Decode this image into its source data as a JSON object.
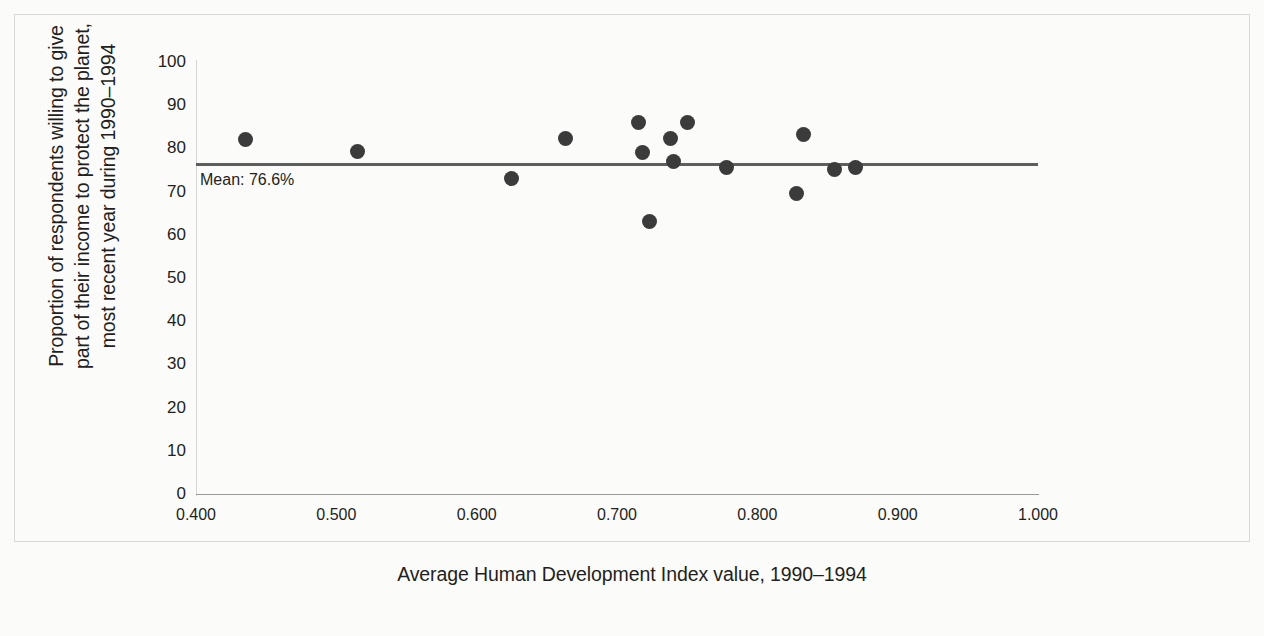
{
  "chart_data": {
    "type": "scatter",
    "title": "",
    "xlabel": "Average Human Development Index value, 1990–1994",
    "ylabel": "Proportion of respondents willing to give\npart of their income to protect the planet,\nmost recent year during 1990–1994",
    "xlim": [
      0.4,
      1.0
    ],
    "ylim": [
      0,
      100
    ],
    "xticks": [
      "0.400",
      "0.500",
      "0.600",
      "0.700",
      "0.800",
      "0.900",
      "1.000"
    ],
    "xtick_values": [
      0.4,
      0.5,
      0.6,
      0.7,
      0.8,
      0.9,
      1.0
    ],
    "yticks": [
      "100",
      "90",
      "80",
      "70",
      "60",
      "50",
      "40",
      "30",
      "20",
      "10",
      "0"
    ],
    "ytick_values": [
      100,
      90,
      80,
      70,
      60,
      50,
      40,
      30,
      20,
      10,
      0
    ],
    "grid": false,
    "legend": false,
    "marker_color": "#3b3b3b",
    "marker_size_px": 15,
    "points": [
      {
        "x": 0.435,
        "y": 82.0
      },
      {
        "x": 0.515,
        "y": 79.3
      },
      {
        "x": 0.625,
        "y": 73.0
      },
      {
        "x": 0.663,
        "y": 82.3
      },
      {
        "x": 0.715,
        "y": 86.0
      },
      {
        "x": 0.718,
        "y": 79.0
      },
      {
        "x": 0.723,
        "y": 63.0
      },
      {
        "x": 0.738,
        "y": 82.2
      },
      {
        "x": 0.74,
        "y": 77.0
      },
      {
        "x": 0.75,
        "y": 86.0
      },
      {
        "x": 0.778,
        "y": 75.5
      },
      {
        "x": 0.828,
        "y": 69.5
      },
      {
        "x": 0.833,
        "y": 83.3
      },
      {
        "x": 0.855,
        "y": 75.2
      },
      {
        "x": 0.87,
        "y": 75.5
      }
    ],
    "mean_line": {
      "value": 76.6,
      "label": "Mean: 76.6%",
      "color": "#5e5e5e",
      "x_start": 0.4,
      "x_end": 1.0
    }
  }
}
